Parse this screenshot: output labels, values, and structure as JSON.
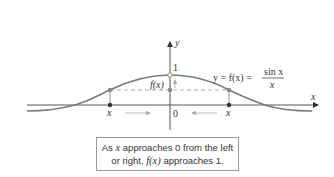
{
  "diagram": {
    "axes": {
      "x_label": "x",
      "y_label": "y",
      "origin_label": "0",
      "y_tick_label": "1"
    },
    "curve": {
      "equation_lhs": "y = f(x) =",
      "numerator": "sin x",
      "denominator": "x",
      "color": "#7a7a7a"
    },
    "point_labels": {
      "fx_label": "f(x)",
      "left_x_label": "x",
      "right_x_label": "x"
    },
    "caption": {
      "line1_pre": "As ",
      "line1_var": "x",
      "line1_post": " approaches 0 from the left",
      "line2_pre": "or right, ",
      "line2_func": "f(x)",
      "line2_post": " approaches 1."
    }
  }
}
